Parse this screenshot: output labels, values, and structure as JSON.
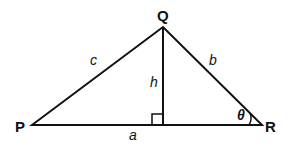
{
  "diagram": {
    "type": "triangle-with-altitude",
    "vertices": {
      "P": "P",
      "Q": "Q",
      "R": "R"
    },
    "sides": {
      "PQ": "c",
      "QR": "b",
      "PR": "a",
      "altitude": "h"
    },
    "angle": {
      "at": "R",
      "label": "θ"
    },
    "right_angle_marker": "foot of altitude from Q on PR",
    "stroke_color": "#111111"
  }
}
